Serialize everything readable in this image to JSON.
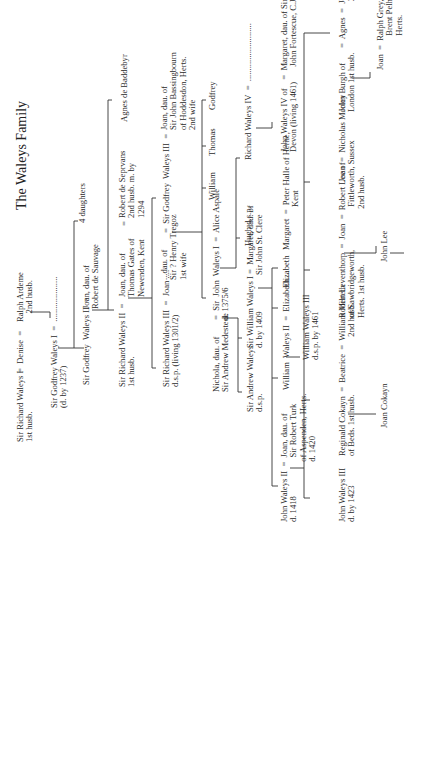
{
  "title": "The Waleys Family",
  "people": {
    "richard1": "Sir Richard Waleys I\n1st husb.",
    "eq_denise": "=  Denise  =",
    "ralph": "Ralph Ardeme\n    2nd husb.",
    "godfrey1": "Sir Godfrey Waleys I  =  .....................\n(d. by 1237)",
    "godfrey2": "Sir Godfrey  Waleys II  =",
    "joan_sauvage": "Joan, dau. of\nRobert de Sauvage",
    "four_daughters": "4 daughters",
    "richard2": "Sir Richard Waleys II  =\n1st husb.",
    "joan_gates": "Joan, dau. of\nThomas Gates of\nNewenden, Kent",
    "eq_seprvans": "=",
    "robert_seprvans": "Robert de Seprvans\n2nd husb. m. by\n1294",
    "agnes_baddebyr": "Agnes de Baddebyr",
    "richard3": "Sir Richard Waleys III  =  Joan ....\nd.s.p. (living 1301/2)",
    "dau_tregoz": "...dau. of\nSir ? Henry Tregoz\n1st wife",
    "godfrey3": "=  Sir Godfrey  Waleys III  =",
    "joan_bassingbourn": "Joan, dau. of\nSir John Bassingbourn\nof Hoddesdon, Herts.\n2nd wife",
    "nichola": "Nichola, dau. of\nSir Andrew Medestede",
    "john1": "=  Sir  John  Waleys I  =  Alice Aspale\nd. 1375/6",
    "william_son": "William",
    "thomas": "Thomas",
    "godfrey_son": "Godfrey",
    "andrew": "Sir Andrew Waleys\nd.s.p.",
    "william1": "Sir William Waleys I =  Margaret, dau. of\nd. by 1409                 Sir John St. Clere",
    "hugh": "Hugh d.s.p.",
    "richard4": "Richard Waleys IV  =  ...........................",
    "john4": "John Waleys IV of    =  Margaret, dau. of Sir\nDevon (living 1461)       John Fortescue, C.J.",
    "william2": "William  Waleys II  =  Elizabeth....",
    "william3": "William Waleys III\nd.s.p. by 1461",
    "elizabeth": "Elizabeth",
    "margaret_halle": "Margaret  =  Peter Halle of Herne,\n                    Kent",
    "john2": "John Waleys II  =  Joan, dau. of\nd. 1418                  Sir Robert Turk\n                            of Aspenden, Herts.\n                            d. 1420",
    "john3": "John Waleys III\nd. by 1423",
    "reginald": "Reginald Cokayn  =  Beatrice  =  William Milreth\nof Beds. 1st husb.                           2nd husb.",
    "joan_cokayn": "Joan Cokayn",
    "robert_leventhorp": "Robert Leventhorp  =  Joan  =  Robert Lee of\nof Sawbridgeworth,                    Fittleworth, Sussex\nHerts. 1st husb.                          2nd husb.",
    "john_lee": "John Lee",
    "joan_morley": "Joan  =  Nicholas Morley",
    "john_burgh": "John Burgh of       =  Agnes  =  John Padyngton.\nLondon 1st husb.                        2nd husb.",
    "joan_grey": "Joan  =  Ralph Grey, jun. of\n                Brent Pelham,\n                Herts."
  }
}
